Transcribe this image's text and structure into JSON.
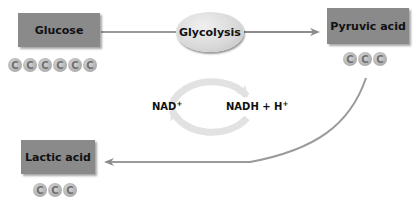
{
  "diagram": {
    "nodes": {
      "glucose": {
        "label": "Glucose",
        "carbons": [
          "C",
          "C",
          "C",
          "C",
          "C",
          "C"
        ]
      },
      "glycolysis": {
        "label": "Glycolysis"
      },
      "pyruvic_acid": {
        "label": "Pyruvic acid",
        "carbons": [
          "C",
          "C",
          "C"
        ]
      },
      "lactic_acid": {
        "label": "Lactic acid",
        "carbons": [
          "C",
          "C",
          "C"
        ]
      }
    },
    "cycle": {
      "left_label": "NAD",
      "left_sup": "+",
      "right_label": "NADH + H",
      "right_sup": "+"
    },
    "edges": [
      {
        "from": "Glucose",
        "to": "Glycolysis"
      },
      {
        "from": "Glycolysis",
        "to": "Pyruvic acid"
      },
      {
        "from": "Pyruvic acid",
        "to": "Lactic acid"
      },
      {
        "from": "NAD+",
        "to": "NADH + H+"
      },
      {
        "from": "NADH + H+",
        "to": "NAD+"
      }
    ],
    "colors": {
      "box_fill": "#8a8a8a",
      "arrow": "#8c8c8c",
      "cycle_arrow": "#e2e2e2",
      "text": "#111111"
    }
  }
}
